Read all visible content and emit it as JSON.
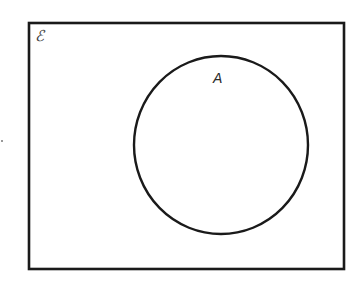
{
  "diagram": {
    "type": "venn",
    "universal_set": {
      "label": "ℰ",
      "rect": {
        "x": 29,
        "y": 23,
        "width": 315,
        "height": 246
      }
    },
    "sets": [
      {
        "label": "A",
        "shape": "circle",
        "center": {
          "x": 221,
          "y": 145
        },
        "rx": 87,
        "ry": 89
      }
    ],
    "colors": {
      "stroke": "#1a1a1a",
      "background": "#ffffff"
    }
  }
}
